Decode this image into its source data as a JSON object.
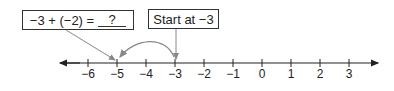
{
  "equation_box": {
    "expression": "−3 + (−2) =",
    "answer": "?"
  },
  "start_box": {
    "label": "Start at −3"
  },
  "number_line": {
    "ticks": [
      {
        "value": -6,
        "label": "−6",
        "x": 88
      },
      {
        "value": -5,
        "label": "−5",
        "x": 117
      },
      {
        "value": -4,
        "label": "−4",
        "x": 146
      },
      {
        "value": -3,
        "label": "−3",
        "x": 175
      },
      {
        "value": -2,
        "label": "−2",
        "x": 204
      },
      {
        "value": -1,
        "label": "−1",
        "x": 233
      },
      {
        "value": 0,
        "label": "0",
        "x": 262
      },
      {
        "value": 1,
        "label": "1",
        "x": 291
      },
      {
        "value": 2,
        "label": "2",
        "x": 320
      },
      {
        "value": 3,
        "label": "3",
        "x": 349
      }
    ],
    "start_value": -3,
    "end_value": -5,
    "jump": -2
  },
  "colors": {
    "line": "#222222",
    "arrow": "#888888",
    "border": "#333333"
  }
}
